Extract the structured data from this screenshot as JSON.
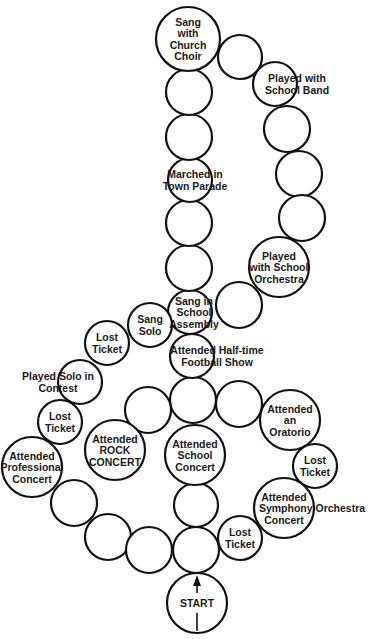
{
  "diagram": {
    "type": "board-game-path",
    "shape": "treble-clef",
    "colors": {
      "background": "#ffffff",
      "stroke": "#111111",
      "text": "#1a1a1a"
    },
    "spaces": [
      {
        "id": "start",
        "cx": 197,
        "cy": 603,
        "r": 30,
        "lines": [
          "START"
        ],
        "arrow": true
      },
      {
        "id": "s1",
        "cx": 196,
        "cy": 550,
        "r": 23,
        "lines": []
      },
      {
        "id": "s2",
        "cx": 196,
        "cy": 505,
        "r": 22,
        "lines": []
      },
      {
        "id": "school-concert",
        "cx": 195,
        "cy": 455,
        "r": 30,
        "lines": [
          "Attended",
          "School",
          "Concert"
        ]
      },
      {
        "id": "s3",
        "cx": 193,
        "cy": 400,
        "r": 23,
        "lines": []
      },
      {
        "id": "halftime",
        "cx": 192,
        "cy": 356,
        "r": 22,
        "lines": [
          "Attended Half-time",
          "Football Show"
        ],
        "text_dx": 25
      },
      {
        "id": "assembly",
        "cx": 190,
        "cy": 312,
        "r": 22,
        "lines": [
          "Sang in",
          "School",
          "Assembly"
        ],
        "text_dx": 4
      },
      {
        "id": "s4",
        "cx": 189,
        "cy": 268,
        "r": 23,
        "lines": []
      },
      {
        "id": "s5",
        "cx": 189,
        "cy": 223,
        "r": 23,
        "lines": []
      },
      {
        "id": "parade",
        "cx": 190,
        "cy": 180,
        "r": 22,
        "lines": [
          "Marched in",
          "Town Parade"
        ],
        "text_dx": 5
      },
      {
        "id": "s6",
        "cx": 189,
        "cy": 137,
        "r": 23,
        "lines": []
      },
      {
        "id": "s7",
        "cx": 189,
        "cy": 92,
        "r": 23,
        "lines": []
      },
      {
        "id": "church-choir",
        "cx": 188,
        "cy": 39,
        "r": 32,
        "lines": [
          "Sang",
          "with",
          "Church",
          "Choir"
        ]
      },
      {
        "id": "s8",
        "cx": 240,
        "cy": 57,
        "r": 22,
        "lines": []
      },
      {
        "id": "school-band",
        "cx": 275,
        "cy": 84,
        "r": 22,
        "lines": [
          "Played with",
          "School Band"
        ],
        "text_dx": 22
      },
      {
        "id": "s9",
        "cx": 287,
        "cy": 129,
        "r": 23,
        "lines": []
      },
      {
        "id": "s10",
        "cx": 299,
        "cy": 174,
        "r": 23,
        "lines": []
      },
      {
        "id": "s11",
        "cx": 302,
        "cy": 218,
        "r": 23,
        "lines": []
      },
      {
        "id": "school-orchestra",
        "cx": 279,
        "cy": 267,
        "r": 30,
        "lines": [
          "Played",
          "with School",
          "Orchestra"
        ]
      },
      {
        "id": "s12",
        "cx": 239,
        "cy": 305,
        "r": 23,
        "lines": []
      },
      {
        "id": "sang-solo",
        "cx": 150,
        "cy": 325,
        "r": 22,
        "lines": [
          "Sang",
          "Solo"
        ]
      },
      {
        "id": "lost-ticket-1",
        "cx": 107,
        "cy": 343,
        "r": 22,
        "lines": [
          "Lost",
          "Ticket"
        ]
      },
      {
        "id": "solo-contest",
        "cx": 80,
        "cy": 382,
        "r": 22,
        "lines": [
          "Played Solo in",
          "Contest"
        ],
        "text_dx": -22
      },
      {
        "id": "lost-ticket-2",
        "cx": 60,
        "cy": 422,
        "r": 22,
        "lines": [
          "Lost",
          "Ticket"
        ]
      },
      {
        "id": "professional-concert",
        "cx": 32,
        "cy": 467,
        "r": 30,
        "lines": [
          "Attended",
          "Professional",
          "Concert"
        ]
      },
      {
        "id": "s13",
        "cx": 74,
        "cy": 503,
        "r": 23,
        "lines": []
      },
      {
        "id": "s14",
        "cx": 108,
        "cy": 537,
        "r": 23,
        "lines": []
      },
      {
        "id": "s15",
        "cx": 149,
        "cy": 550,
        "r": 23,
        "lines": []
      },
      {
        "id": "s16",
        "cx": 148,
        "cy": 410,
        "r": 23,
        "lines": []
      },
      {
        "id": "rock-concert",
        "cx": 115,
        "cy": 450,
        "r": 30,
        "lines": [
          "Attended",
          "ROCK",
          "CONCERT"
        ]
      },
      {
        "id": "s17",
        "cx": 239,
        "cy": 404,
        "r": 23,
        "lines": []
      },
      {
        "id": "oratorio",
        "cx": 290,
        "cy": 420,
        "r": 30,
        "lines": [
          "Attended",
          "an",
          "Oratorio"
        ]
      },
      {
        "id": "lost-ticket-3",
        "cx": 315,
        "cy": 466,
        "r": 22,
        "lines": [
          "Lost",
          "Ticket"
        ]
      },
      {
        "id": "symphony",
        "cx": 284,
        "cy": 508,
        "r": 30,
        "lines": [
          "Attended",
          "Symphony Orchestra",
          "Concert"
        ],
        "text_dx": 0,
        "line_dx": [
          0,
          28,
          0
        ]
      },
      {
        "id": "lost-ticket-4",
        "cx": 240,
        "cy": 538,
        "r": 22,
        "lines": [
          "Lost",
          "Ticket"
        ]
      }
    ]
  }
}
